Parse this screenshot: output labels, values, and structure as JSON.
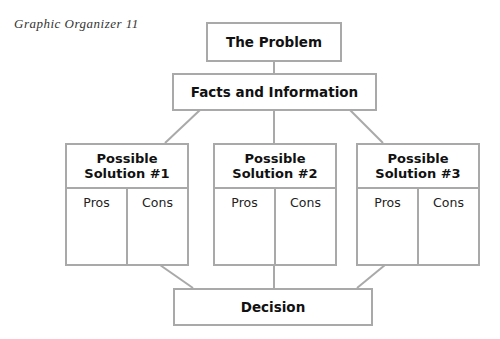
{
  "caption": "Graphic Organizer 11",
  "problem": {
    "label": "The Problem"
  },
  "facts": {
    "label": "Facts and Information"
  },
  "solutions": [
    {
      "line1": "Possible",
      "line2": "Solution #1",
      "pros": "Pros",
      "cons": "Cons"
    },
    {
      "line1": "Possible",
      "line2": "Solution #2",
      "pros": "Pros",
      "cons": "Cons"
    },
    {
      "line1": "Possible",
      "line2": "Solution #3",
      "pros": "Pros",
      "cons": "Cons"
    }
  ],
  "decision": {
    "label": "Decision"
  },
  "colors": {
    "border": "#a9a9a9",
    "text": "#111111",
    "background": "#ffffff"
  }
}
